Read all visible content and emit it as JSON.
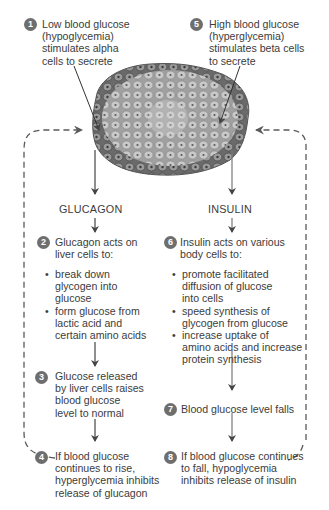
{
  "colors": {
    "badge": "#6e6e6e",
    "text": "#3c3c3c",
    "arrow": "#444444",
    "dashed_loop": "#5a5a5a",
    "islet_cell": "#b8b8b8",
    "islet_cell_dark": "#6a6a6a"
  },
  "steps": [
    {
      "num": "1",
      "text": [
        "Low blood glucose",
        "(hypoglycemia)",
        "stimulates alpha",
        "cells to secrete"
      ]
    },
    {
      "num": "2",
      "text": [
        "Glucagon acts on",
        "liver cells to:"
      ],
      "bullets": [
        [
          "break down",
          "glycogen into",
          "glucose"
        ],
        [
          "form glucose from",
          "lactic acid and",
          "certain amino acids"
        ]
      ]
    },
    {
      "num": "3",
      "text": [
        "Glucose released",
        "by liver cells raises",
        "blood glucose",
        "level to normal"
      ]
    },
    {
      "num": "4",
      "text": [
        "If blood glucose",
        "continues to rise,",
        "hyperglycemia inhibits",
        "release of glucagon"
      ]
    },
    {
      "num": "5",
      "text": [
        "High blood glucose",
        "(hyperglycemia)",
        "stimulates beta cells",
        "to secrete"
      ]
    },
    {
      "num": "6",
      "text": [
        "Insulin acts on various",
        "body cells to:"
      ],
      "bullets": [
        [
          "promote facilitated",
          "diffusion of glucose",
          "into cells"
        ],
        [
          "speed synthesis of",
          "glycogen from glucose"
        ],
        [
          "increase uptake of",
          "amino acids and increase",
          "protein synthesis"
        ]
      ]
    },
    {
      "num": "7",
      "text": [
        "Blood glucose level falls"
      ]
    },
    {
      "num": "8",
      "text": [
        "If blood glucose continues",
        "to fall, hypoglycemia",
        "inhibits release of insulin"
      ]
    }
  ],
  "hormones": {
    "left": "GLUCAGON",
    "right": "INSULIN"
  },
  "islet_label": "pancreatic-islet-illustration"
}
